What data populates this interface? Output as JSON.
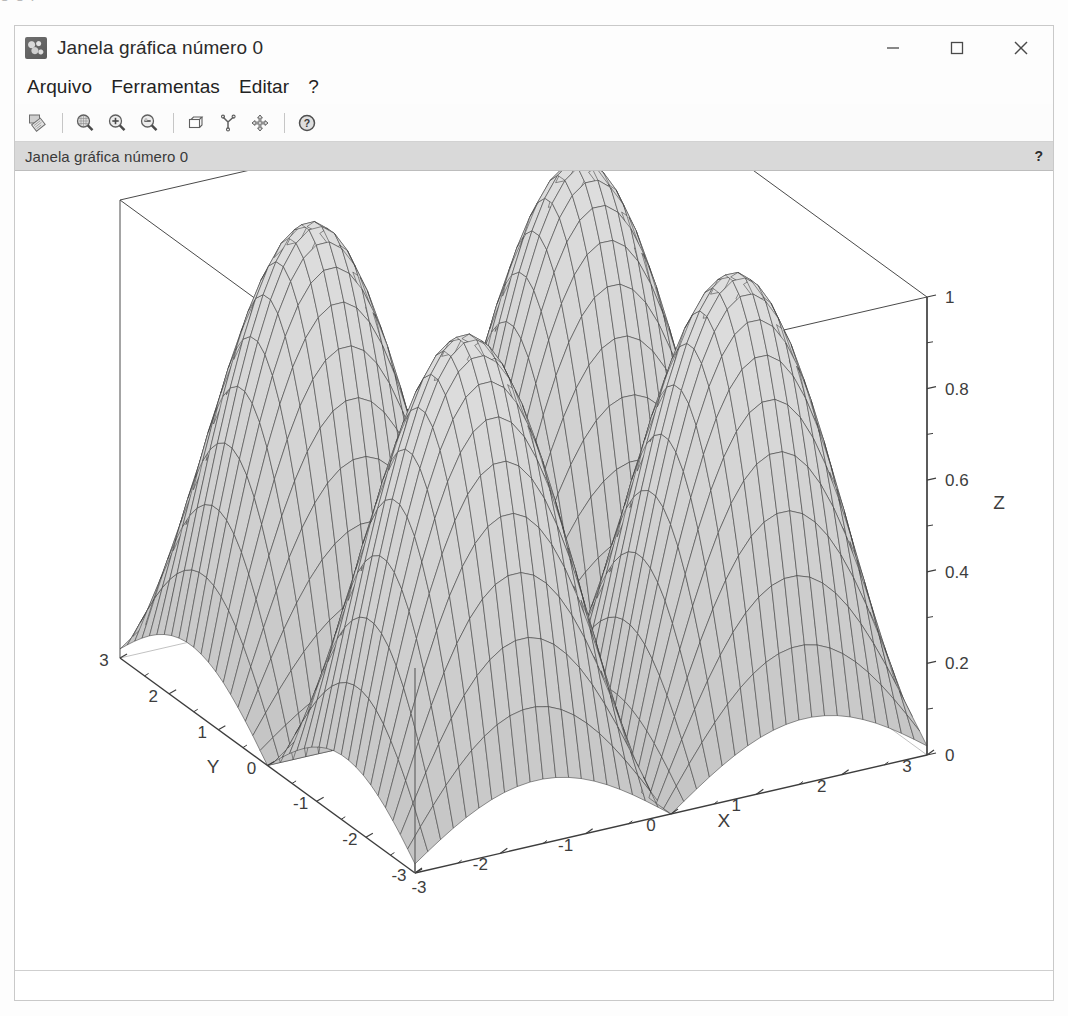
{
  "window": {
    "title": "Janela gráfica número 0",
    "icon": "scilab-graphic-icon",
    "controls": {
      "minimize": "minimize-icon",
      "maximize": "maximize-icon",
      "close": "close-icon"
    }
  },
  "menubar": {
    "items": [
      {
        "label": "Arquivo"
      },
      {
        "label": "Ferramentas"
      },
      {
        "label": "Editar"
      },
      {
        "label": "?"
      }
    ]
  },
  "toolbar": {
    "buttons": [
      {
        "name": "export-icon",
        "tip": "Exportar"
      },
      {
        "name": "zoom-box-icon",
        "tip": "Zoom área"
      },
      {
        "name": "zoom-in-icon",
        "tip": "Ampliar"
      },
      {
        "name": "zoom-out-icon",
        "tip": "Reduzir"
      },
      {
        "name": "cube-rotate-icon",
        "tip": "Rotação 3D"
      },
      {
        "name": "axes-icon",
        "tip": "Eixos"
      },
      {
        "name": "pan-move-icon",
        "tip": "Mover"
      },
      {
        "name": "help-circle-icon",
        "tip": "Ajuda"
      }
    ]
  },
  "infobar": {
    "label": "Janela gráfica número 0",
    "help": "?"
  },
  "statusbar": {
    "text": ""
  },
  "chart_data": {
    "type": "surface",
    "title": "",
    "xlabel": "X",
    "ylabel": "Y",
    "zlabel": "Z",
    "xlim": [
      -3,
      3
    ],
    "ylim": [
      -3,
      3
    ],
    "zlim": [
      0,
      1
    ],
    "xticks": [
      -3,
      -2,
      -1,
      0,
      1,
      2,
      3
    ],
    "xticklabels": [
      "-3",
      "-2",
      "-1",
      "0",
      "1",
      "2",
      "3"
    ],
    "yticks": [
      -3,
      -2,
      -1,
      0,
      1,
      2,
      3
    ],
    "yticklabels": [
      "-3",
      "-2",
      "-1",
      "0",
      "1",
      "2",
      "3"
    ],
    "zticks": [
      0,
      0.2,
      0.4,
      0.6,
      0.8,
      1
    ],
    "zticklabels": [
      "0",
      "0.2",
      "0.4",
      "0.6",
      "0.8",
      "1"
    ],
    "zminorticks": [
      0.1,
      0.3,
      0.5,
      0.7,
      0.9
    ],
    "surface_expression": "abs(sin(x)*sin(y))",
    "mesh_n": 41,
    "grid": false,
    "legend": null,
    "mesh_color": "#3a3a3a",
    "face_color": "#cfcfcf",
    "box_color": "#4a4a4a",
    "view": {
      "azimuth": -52,
      "elevation": 22
    }
  }
}
